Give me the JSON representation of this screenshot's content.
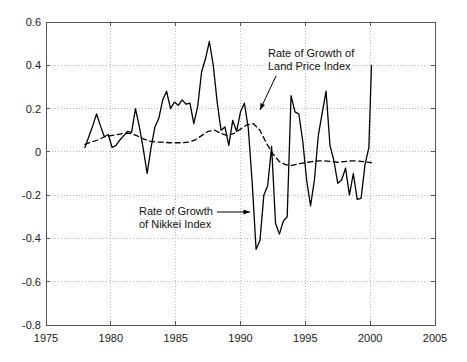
{
  "chart_data": {
    "type": "line",
    "title": "",
    "xlabel": "",
    "ylabel": "",
    "xlim": [
      1975,
      2005
    ],
    "ylim": [
      -0.8,
      0.6
    ],
    "grid": true,
    "legend_position": "none",
    "xticks": [
      "1975",
      "1980",
      "1985",
      "1990",
      "1995",
      "2000",
      "2005"
    ],
    "xtick_values": [
      1975,
      1980,
      1985,
      1990,
      1995,
      2000,
      2005
    ],
    "yticks": [
      "0.6",
      "0.4",
      "0.2",
      "0",
      "-0.2",
      "-0.4",
      "-0.6",
      "-0.8"
    ],
    "ytick_values": [
      0.6,
      0.4,
      0.2,
      0,
      -0.2,
      -0.4,
      -0.6,
      -0.8
    ],
    "series": [
      {
        "name": "Rate of Growth of Nikkei Index",
        "style": "solid",
        "color": "#000000",
        "x": [
          1978.0,
          1978.3,
          1978.6,
          1978.9,
          1979.2,
          1979.5,
          1979.8,
          1980.1,
          1980.4,
          1980.7,
          1981.0,
          1981.3,
          1981.6,
          1981.9,
          1982.2,
          1982.5,
          1982.8,
          1983.1,
          1983.4,
          1983.7,
          1984.0,
          1984.3,
          1984.6,
          1984.9,
          1985.2,
          1985.5,
          1985.8,
          1986.1,
          1986.4,
          1986.7,
          1987.0,
          1987.3,
          1987.6,
          1987.9,
          1988.2,
          1988.5,
          1988.8,
          1989.1,
          1989.4,
          1989.7,
          1990.0,
          1990.3,
          1990.6,
          1990.9,
          1991.2,
          1991.5,
          1991.8,
          1992.1,
          1992.4,
          1992.7,
          1993.0,
          1993.3,
          1993.6,
          1993.9,
          1994.2,
          1994.5,
          1994.8,
          1995.1,
          1995.4,
          1995.7,
          1996.0,
          1996.3,
          1996.6,
          1996.9,
          1997.2,
          1997.5,
          1997.8,
          1998.1,
          1998.4,
          1998.7,
          1999.0,
          1999.3,
          1999.6,
          1999.9,
          2000.1
        ],
        "y": [
          0.02,
          0.07,
          0.12,
          0.175,
          0.12,
          0.07,
          0.08,
          0.02,
          0.03,
          0.055,
          0.075,
          0.095,
          0.09,
          0.2,
          0.115,
          0.015,
          -0.1,
          0.02,
          0.115,
          0.155,
          0.24,
          0.28,
          0.2,
          0.23,
          0.215,
          0.24,
          0.22,
          0.225,
          0.13,
          0.21,
          0.37,
          0.43,
          0.51,
          0.4,
          0.23,
          0.1,
          0.115,
          0.03,
          0.145,
          0.095,
          0.185,
          0.225,
          0.11,
          -0.14,
          -0.45,
          -0.41,
          -0.2,
          -0.155,
          0.025,
          -0.33,
          -0.38,
          -0.32,
          -0.3,
          0.26,
          0.185,
          0.175,
          0.05,
          -0.13,
          -0.25,
          -0.13,
          0.075,
          0.18,
          0.28,
          0.03,
          -0.04,
          -0.145,
          -0.13,
          -0.075,
          -0.2,
          -0.1,
          -0.22,
          -0.215,
          -0.06,
          0.02,
          0.4
        ]
      },
      {
        "name": "Rate of Growth of Land Price Index",
        "style": "dashed",
        "color": "#000000",
        "x": [
          1978.0,
          1978.5,
          1979.0,
          1979.5,
          1980.0,
          1980.5,
          1981.0,
          1981.5,
          1982.0,
          1982.5,
          1983.0,
          1983.5,
          1984.0,
          1984.5,
          1985.0,
          1985.5,
          1986.0,
          1986.5,
          1987.0,
          1987.5,
          1988.0,
          1988.5,
          1989.0,
          1989.5,
          1990.0,
          1990.5,
          1991.0,
          1991.5,
          1992.0,
          1992.5,
          1993.0,
          1993.5,
          1994.0,
          1994.5,
          1995.0,
          1995.5,
          1996.0,
          1996.5,
          1997.0,
          1997.5,
          1998.0,
          1998.5,
          1999.0,
          1999.5,
          2000.1
        ],
        "y": [
          0.035,
          0.045,
          0.055,
          0.07,
          0.075,
          0.08,
          0.085,
          0.085,
          0.075,
          0.06,
          0.05,
          0.045,
          0.045,
          0.042,
          0.042,
          0.042,
          0.045,
          0.055,
          0.075,
          0.095,
          0.1,
          0.085,
          0.075,
          0.085,
          0.105,
          0.125,
          0.13,
          0.1,
          0.04,
          -0.01,
          -0.045,
          -0.06,
          -0.062,
          -0.055,
          -0.05,
          -0.045,
          -0.042,
          -0.042,
          -0.045,
          -0.048,
          -0.045,
          -0.042,
          -0.042,
          -0.045,
          -0.05
        ]
      }
    ],
    "annotations": [
      {
        "id": "land-price-annotation",
        "line1": "Rate of Growth of",
        "line2": "Land Price Index",
        "text_x": 268,
        "text_y": 47,
        "arrow_from_x": 276,
        "arrow_from_y": 76,
        "arrow_to_x": 260,
        "arrow_to_y": 110
      },
      {
        "id": "nikkei-annotation",
        "line1": "Rate of Growth",
        "line2": "of Nikkei Index",
        "text_x": 139,
        "text_y": 205,
        "arrow_from_x": 217,
        "arrow_from_y": 212,
        "arrow_to_x": 250,
        "arrow_to_y": 212
      }
    ]
  },
  "axes": {
    "frame_color": "#555555",
    "grid_color": "#bbbbbb",
    "text_color": "#1a1a1a"
  }
}
